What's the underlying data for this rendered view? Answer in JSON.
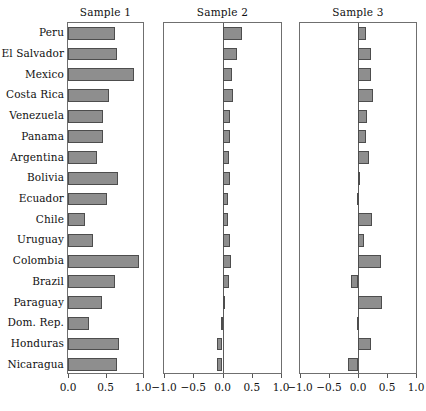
{
  "chart_data": {
    "type": "bar",
    "title": "",
    "orientation": "horizontal",
    "grid": false,
    "legend": false,
    "categories": [
      "Peru",
      "El Salvador",
      "Mexico",
      "Costa Rica",
      "Venezuela",
      "Panama",
      "Argentina",
      "Bolivia",
      "Ecuador",
      "Chile",
      "Uruguay",
      "Colombia",
      "Brazil",
      "Paraguay",
      "Dom. Rep.",
      "Honduras",
      "Nicaragua"
    ],
    "panels": [
      {
        "name": "Sample 1",
        "xlabel": "",
        "ylabel": "",
        "xlim": [
          0.0,
          1.0
        ],
        "xticks": [
          0.0,
          0.5,
          1.0
        ],
        "xticklabels": [
          "0.0",
          "0.5",
          "1.0"
        ],
        "values": [
          0.62,
          0.65,
          0.88,
          0.55,
          0.47,
          0.47,
          0.38,
          0.67,
          0.52,
          0.22,
          0.33,
          0.95,
          0.62,
          0.45,
          0.28,
          0.68,
          0.65
        ]
      },
      {
        "name": "Sample 2",
        "xlabel": "",
        "ylabel": "",
        "xlim": [
          -1.0,
          1.0
        ],
        "xticks": [
          -1.0,
          -0.5,
          0.0,
          0.5,
          1.0
        ],
        "xticklabels": [
          "-1.0",
          "-0.5",
          "0.0",
          "0.5",
          "1.0"
        ],
        "values": [
          0.33,
          0.25,
          0.16,
          0.18,
          0.13,
          0.13,
          0.11,
          0.13,
          0.09,
          0.1,
          0.12,
          0.14,
          0.11,
          0.01,
          -0.02,
          -0.09,
          -0.1,
          -0.43
        ]
      },
      {
        "name": "Sample 3",
        "xlabel": "",
        "ylabel": "",
        "xlim": [
          -1.0,
          1.0
        ],
        "xticks": [
          -1.0,
          -0.5,
          0.0,
          0.5,
          1.0
        ],
        "xticklabels": [
          "-1.0",
          "-0.5",
          "0.0",
          "0.5",
          "1.0"
        ],
        "values": [
          0.13,
          0.22,
          0.22,
          0.25,
          0.16,
          0.13,
          0.19,
          0.0,
          -0.02,
          0.24,
          0.11,
          0.4,
          -0.12,
          0.41,
          -0.01,
          0.22,
          -0.17
        ]
      }
    ],
    "colors": {
      "bar_fill": "#8e8e8e",
      "bar_edge": "#4d4d4d",
      "frame": "#6f6f6f",
      "text": "#111111",
      "background": "#ffffff"
    }
  }
}
